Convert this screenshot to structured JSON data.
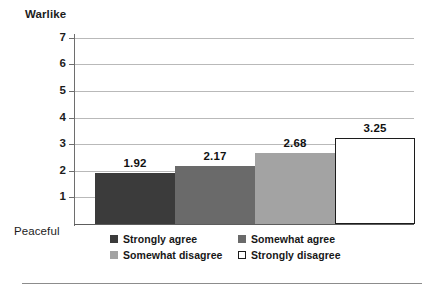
{
  "chart_data": {
    "type": "bar",
    "title": "",
    "subtitle": "",
    "xlabel": "",
    "ylabel": "",
    "categories": [
      "Strongly agree",
      "Somewhat agree",
      "Somewhat disagree",
      "Strongly disagree"
    ],
    "values": [
      1.92,
      2.17,
      2.68,
      3.25
    ],
    "value_labels": [
      "1.92",
      "2.17",
      "2.68",
      "3.25"
    ],
    "ylim": [
      0,
      7
    ],
    "yticks": [
      7,
      6,
      5,
      4,
      3,
      2,
      1
    ],
    "ytick_labels": [
      "7",
      "6",
      "5",
      "4",
      "3",
      "2",
      "1"
    ],
    "axis_top_label": "Warlike",
    "axis_bottom_label": "Peaceful",
    "grid": true,
    "grid_axis": "y",
    "legend_position": "bottom",
    "series_colors": [
      "#3b3b3b",
      "#6a6a6a",
      "#a3a3a3",
      "#ffffff"
    ],
    "series_border_colors": [
      "#3b3b3b",
      "#6a6a6a",
      "#a3a3a3",
      "#1c1c1c"
    ],
    "legend": [
      {
        "label": "Strongly agree",
        "color": "#3b3b3b",
        "border": "#3b3b3b"
      },
      {
        "label": "Somewhat agree",
        "color": "#6a6a6a",
        "border": "#6a6a6a"
      },
      {
        "label": "Somewhat disagree",
        "color": "#a3a3a3",
        "border": "#a3a3a3"
      },
      {
        "label": "Strongly disagree",
        "color": "#ffffff",
        "border": "#1c1c1c"
      }
    ]
  },
  "colors": {
    "background": "#ffffff",
    "gridline": "#b9b9b9",
    "axis": "#6e6e6e",
    "text": "#1c1c1c",
    "rule": "#8c8c8c"
  }
}
